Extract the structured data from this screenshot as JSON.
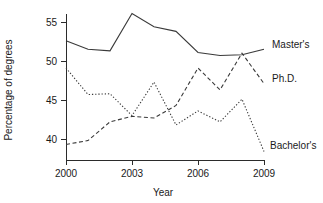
{
  "chart_data": {
    "type": "line",
    "title": "",
    "xlabel": "Year",
    "ylabel": "Percentage of degrees",
    "x": [
      2000,
      2001,
      2002,
      2003,
      2004,
      2005,
      2006,
      2007,
      2008,
      2009
    ],
    "xlim": [
      2000,
      2009
    ],
    "ylim": [
      38.2,
      56.4
    ],
    "xticks": [
      2000,
      2003,
      2006,
      2009
    ],
    "xticklabels": [
      "2000",
      "2003",
      "2006",
      "2009"
    ],
    "yticks": [
      40,
      45,
      50,
      55
    ],
    "yticklabels": [
      "40",
      "45",
      "50",
      "55"
    ],
    "grid": false,
    "legend_position": "right-inline-labels",
    "series": [
      {
        "name": "Master's",
        "style": "solid",
        "color": "#3a3a3a",
        "values": [
          52.6,
          51.5,
          51.3,
          56.1,
          54.4,
          53.8,
          51.1,
          50.7,
          50.8,
          51.5
        ]
      },
      {
        "name": "Ph.D.",
        "style": "dashed",
        "color": "#3a3a3a",
        "values": [
          39.3,
          39.8,
          42.2,
          42.9,
          42.7,
          44.3,
          49.1,
          46.3,
          51.0,
          47.1
        ]
      },
      {
        "name": "Bachelor's",
        "style": "dotted",
        "color": "#3a3a3a",
        "values": [
          49.1,
          45.7,
          45.8,
          43.0,
          47.3,
          41.8,
          43.6,
          42.2,
          45.1,
          38.4
        ]
      }
    ],
    "annotations": [
      {
        "text": "Master's",
        "series": "Master's",
        "x": 272,
        "y": 48
      },
      {
        "text": "Ph.D.",
        "series": "Ph.D.",
        "x": 272,
        "y": 82
      },
      {
        "text": "Bachelor's",
        "series": "Bachelor's",
        "x": 270,
        "y": 149
      }
    ]
  },
  "axes": {
    "x_title": "Year",
    "y_title": "Percentage of degrees"
  }
}
